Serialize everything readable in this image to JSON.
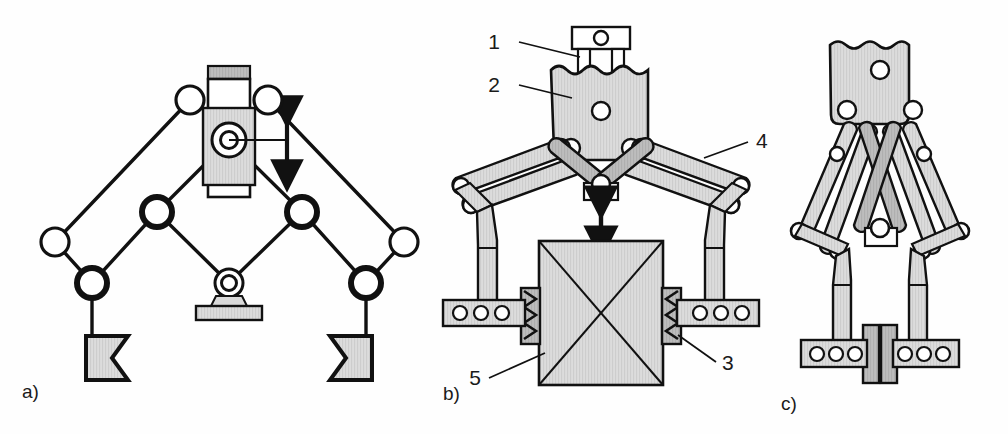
{
  "figure": {
    "background_color": "#fefefe",
    "line_color": "#111111",
    "fill_color": "#d9d9d9",
    "fill_color_dark": "#b5b5b5",
    "white": "#ffffff"
  },
  "subfigures": [
    {
      "key": "a",
      "label": "a)",
      "caption": "kinematic schematic with slider input"
    },
    {
      "key": "b",
      "label": "b)",
      "caption": "open gripper assembly with part held"
    },
    {
      "key": "c",
      "label": "c)",
      "caption": "closed gripper assembly"
    }
  ],
  "callouts": [
    {
      "id": "1",
      "label": "1",
      "target": "actuator-rod"
    },
    {
      "id": "2",
      "label": "2",
      "target": "gripper-body"
    },
    {
      "id": "3",
      "label": "3",
      "target": "spring-pad"
    },
    {
      "id": "4",
      "label": "4",
      "target": "upper-link-arm"
    },
    {
      "id": "5",
      "label": "5",
      "target": "workpiece"
    }
  ],
  "diagram_a": {
    "name": "kinematic-schematic",
    "elements": {
      "slider_guide": "vertical prismatic guide",
      "slider_block": "moving slider block",
      "motion_arrow": "vertical double arrow",
      "ground_pivot": "fixed ground pivot",
      "gripper_fingers": 2,
      "revolute_joints": 7
    }
  },
  "diagram_b": {
    "name": "open-gripper-assembly",
    "elements": {
      "actuator_rod": "rod with pin hole",
      "body_holes": 3,
      "pad_holes_per_side": 3,
      "springs_per_side": 1,
      "workpiece": "square block with X cross",
      "motion_arrow": "vertical double arrow"
    }
  },
  "diagram_c": {
    "name": "closed-gripper-assembly",
    "elements": {
      "body_holes": 3,
      "pad_holes_per_side": 3,
      "jaws_closed": true
    }
  }
}
